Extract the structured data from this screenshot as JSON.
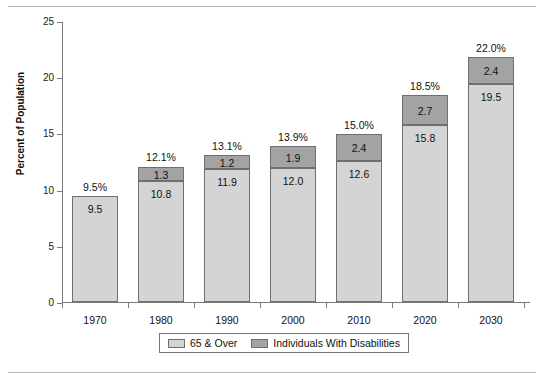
{
  "chart_data": {
    "type": "bar",
    "subtype": "stacked-bar",
    "title": "",
    "xlabel": "",
    "ylabel": "Percent of Population",
    "ylim": [
      0,
      25
    ],
    "yticks": [
      0,
      5,
      10,
      15,
      20,
      25
    ],
    "grid": false,
    "legend_position": "bottom",
    "categories": [
      "1970",
      "1980",
      "1990",
      "2000",
      "2010",
      "2020",
      "2030"
    ],
    "series": [
      {
        "name": "65 & Over",
        "color": "#d4d4d4",
        "values": [
          9.5,
          10.8,
          11.9,
          12.0,
          12.6,
          15.8,
          19.5
        ],
        "labels": [
          "9.5",
          "10.8",
          "11.9",
          "12.0",
          "12.6",
          "15.8",
          "19.5"
        ]
      },
      {
        "name": "Individuals With Disabilities",
        "color": "#a3a3a3",
        "values": [
          0,
          1.3,
          1.2,
          1.9,
          2.4,
          2.7,
          2.4
        ],
        "labels": [
          "",
          "1.3",
          "1.2",
          "1.9",
          "2.4",
          "2.7",
          "2.4"
        ]
      }
    ],
    "totals": [
      9.5,
      12.1,
      13.1,
      13.9,
      15.0,
      18.5,
      22.0
    ],
    "total_labels": [
      "9.5%",
      "12.1%",
      "13.1%",
      "13.9%",
      "15.0%",
      "18.5%",
      "22.0%"
    ]
  },
  "axis": {
    "y_title": "Percent of Population",
    "y_tick_labels": [
      "0",
      "5",
      "10",
      "15",
      "20",
      "25"
    ],
    "x_tick_labels": [
      "1970",
      "1980",
      "1990",
      "2000",
      "2010",
      "2020",
      "2030"
    ]
  },
  "legend": {
    "items": [
      {
        "label": "65 & Over",
        "swatch": "light"
      },
      {
        "label": "Individuals With Disabilities",
        "swatch": "dark"
      }
    ]
  },
  "colors": {
    "series_light": "#d4d4d4",
    "series_dark": "#a3a3a3",
    "bar_border": "#6f6f6f",
    "axis": "#7a7a7a",
    "rule": "#b9b9b9",
    "text": "#111111"
  }
}
